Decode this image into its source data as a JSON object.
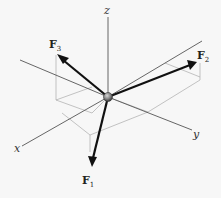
{
  "diagram": {
    "axes": {
      "x_label": "x",
      "y_label": "y",
      "z_label": "z"
    },
    "forces": [
      {
        "name": "F",
        "sub": "1",
        "direction": "down, toward +x"
      },
      {
        "name": "F",
        "sub": "2",
        "direction": "up-right, toward +y"
      },
      {
        "name": "F",
        "sub": "3",
        "direction": "up-left, toward -y"
      }
    ],
    "colors": {
      "background": "#f7f7f7",
      "axis": "#555555",
      "construction_lines": "#aaaaaa",
      "force_arrows": "#111111",
      "particle": "#888888"
    }
  }
}
